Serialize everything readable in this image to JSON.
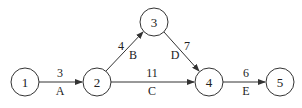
{
  "diagram": {
    "type": "activity-on-arrow network",
    "nodes": [
      {
        "id": "1",
        "label": "1",
        "x": 25,
        "y": 82
      },
      {
        "id": "2",
        "label": "2",
        "x": 97,
        "y": 82
      },
      {
        "id": "3",
        "label": "3",
        "x": 154,
        "y": 22
      },
      {
        "id": "4",
        "label": "4",
        "x": 209,
        "y": 82
      },
      {
        "id": "5",
        "label": "5",
        "x": 280,
        "y": 82
      }
    ],
    "edges": [
      {
        "from": "1",
        "to": "2",
        "activity": "A",
        "duration": "3"
      },
      {
        "from": "2",
        "to": "3",
        "activity": "B",
        "duration": "4"
      },
      {
        "from": "2",
        "to": "4",
        "activity": "C",
        "duration": "11"
      },
      {
        "from": "3",
        "to": "4",
        "activity": "D",
        "duration": "7"
      },
      {
        "from": "4",
        "to": "5",
        "activity": "E",
        "duration": "6"
      }
    ],
    "colors": {
      "stroke": "#333333",
      "text": "#222222",
      "background": "#ffffff"
    }
  }
}
